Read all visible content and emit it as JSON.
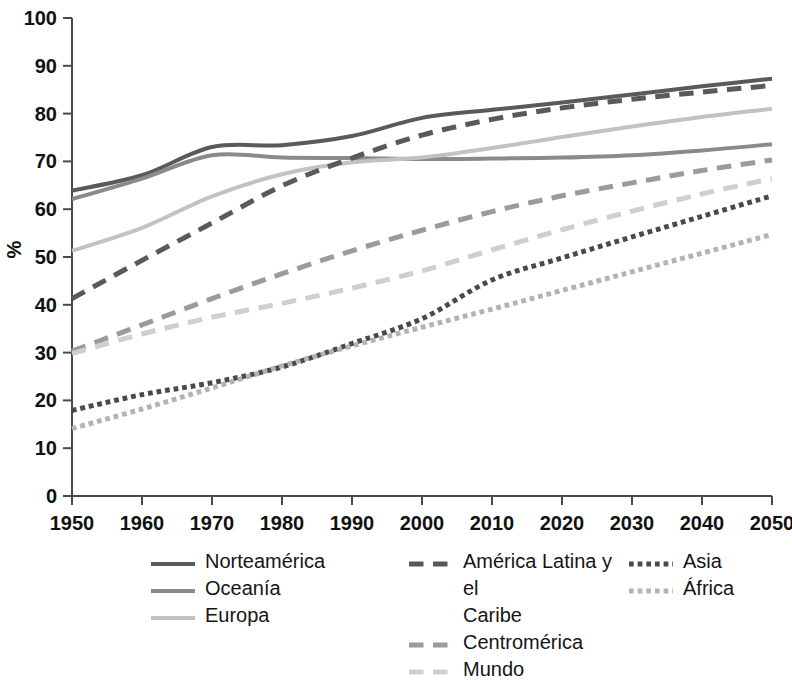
{
  "chart_data": {
    "type": "line",
    "title": "",
    "subtitle": "",
    "xlabel": "",
    "ylabel": "%",
    "xlim": [
      1950,
      2050
    ],
    "ylim": [
      0,
      100
    ],
    "grid": false,
    "legend_position": "bottom",
    "x": [
      1950,
      1960,
      1970,
      1980,
      1990,
      2000,
      2010,
      2020,
      2030,
      2040,
      2050
    ],
    "xticks": [
      "1950",
      "1960",
      "1970",
      "1980",
      "1990",
      "2000",
      "2010",
      "2020",
      "2030",
      "2040",
      "2050"
    ],
    "yticks": [
      "0",
      "10",
      "20",
      "30",
      "40",
      "50",
      "60",
      "70",
      "80",
      "90",
      "100"
    ],
    "series": [
      {
        "name": "Norteamérica",
        "style": "solid",
        "color": "#5a5a5a",
        "width": 4,
        "values": [
          63.9,
          67.1,
          73.0,
          73.4,
          75.3,
          79.1,
          80.8,
          82.3,
          84.0,
          85.7,
          87.3
        ]
      },
      {
        "name": "Oceanía",
        "style": "solid",
        "color": "#8a8a8a",
        "width": 4,
        "values": [
          62.1,
          66.4,
          71.3,
          70.8,
          70.7,
          70.5,
          70.6,
          70.8,
          71.3,
          72.3,
          73.6
        ]
      },
      {
        "name": "Europa",
        "style": "solid",
        "color": "#c2c2c2",
        "width": 4,
        "values": [
          51.3,
          56.1,
          62.7,
          67.3,
          69.8,
          70.8,
          72.8,
          75.1,
          77.3,
          79.3,
          81.0
        ]
      },
      {
        "name": "América Latina y el\nCaribe",
        "style": "dashed",
        "color": "#5a5a5a",
        "width": 5,
        "values": [
          41.3,
          49.3,
          57.1,
          64.9,
          70.7,
          75.5,
          78.8,
          81.2,
          83.0,
          84.5,
          85.9
        ]
      },
      {
        "name": "Centromérica",
        "style": "dashed",
        "color": "#9b9b9b",
        "width": 5,
        "values": [
          30.3,
          35.8,
          41.3,
          46.5,
          51.3,
          55.6,
          59.5,
          62.8,
          65.5,
          68.1,
          70.3
        ]
      },
      {
        "name": "Mundo",
        "style": "dashed",
        "color": "#cfcfcf",
        "width": 5,
        "values": [
          29.8,
          33.9,
          37.4,
          40.3,
          43.5,
          47.1,
          51.5,
          55.7,
          59.6,
          63.2,
          66.4
        ]
      },
      {
        "name": "Asia",
        "style": "dotted",
        "color": "#4a4a4a",
        "width": 5,
        "values": [
          17.9,
          21.2,
          23.7,
          27.0,
          31.9,
          37.1,
          45.2,
          49.8,
          54.2,
          58.5,
          62.8
        ]
      },
      {
        "name": "África",
        "style": "dotted",
        "color": "#b3b3b3",
        "width": 5,
        "values": [
          14.1,
          18.2,
          22.6,
          27.2,
          31.4,
          35.3,
          39.1,
          43.0,
          46.9,
          50.8,
          54.7
        ]
      }
    ]
  },
  "axis": {
    "y_title": "%"
  },
  "legend": {
    "columns": [
      [
        "Norteamérica",
        "Oceanía",
        "Europa"
      ],
      [
        "América Latina y el\nCaribe",
        "Centromérica",
        "Mundo"
      ],
      [
        "Asia",
        "África"
      ]
    ]
  }
}
